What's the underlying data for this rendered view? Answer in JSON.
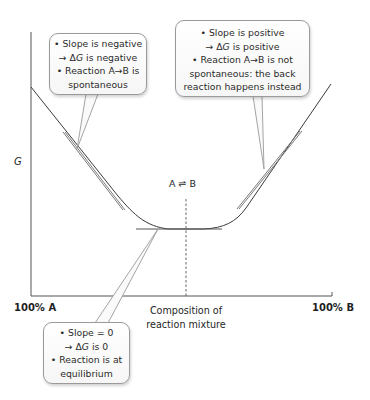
{
  "diagram": {
    "y_axis": {
      "label": "G"
    },
    "x_axis": {
      "title": "Composition of reaction mixture",
      "title_lines": [
        "Composition of",
        "reaction mixture"
      ],
      "left_end": "100% A",
      "right_end": "100% B"
    },
    "equilibrium_label": "A ⇌ B",
    "callouts": {
      "left": {
        "lines": [
          {
            "bullet": true,
            "text": "Slope is negative"
          },
          {
            "bullet": false,
            "prefix": "→ Δ",
            "italic": "G",
            "text": " is negative"
          },
          {
            "bullet": true,
            "text": "Reaction A→B is"
          },
          {
            "bullet": false,
            "text": "spontaneous"
          }
        ]
      },
      "right": {
        "lines": [
          {
            "bullet": true,
            "text": "Slope is positive"
          },
          {
            "bullet": false,
            "prefix": "→ Δ",
            "italic": "G",
            "text": " is positive"
          },
          {
            "bullet": true,
            "text": "Reaction A→B is not"
          },
          {
            "bullet": false,
            "text": "spontaneous: the back"
          },
          {
            "bullet": false,
            "text": "reaction happens instead"
          }
        ]
      },
      "bottom": {
        "lines": [
          {
            "bullet": true,
            "text": "Slope = 0"
          },
          {
            "bullet": false,
            "prefix": "→ Δ",
            "italic": "G",
            "text": " is 0"
          },
          {
            "bullet": true,
            "text": "Reaction is at"
          },
          {
            "bullet": false,
            "text": "equilibrium"
          }
        ]
      }
    },
    "colors": {
      "curve": "#3a3a3a",
      "tangent": "#7a7a7a",
      "axis": "#555555",
      "bubble_border": "#9a9a9a",
      "dashed": "#555555"
    }
  }
}
